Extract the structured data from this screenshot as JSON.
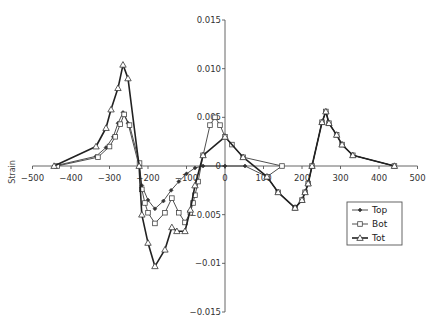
{
  "chart_data": {
    "type": "line",
    "title": "",
    "xlabel": "",
    "ylabel": "Strain",
    "xlim": [
      -500,
      500
    ],
    "ylim": [
      -0.015,
      0.015
    ],
    "xticks": [
      -500,
      -400,
      -300,
      -200,
      -100,
      0,
      100,
      200,
      300,
      400,
      500
    ],
    "xtick_labels": [
      "-500",
      "-400",
      "-300",
      "-200",
      "-100",
      "0",
      "100",
      "200",
      "300",
      "400",
      "500"
    ],
    "yticks": [
      0.015,
      0.01,
      0.005,
      0,
      -0.005,
      -0.01,
      -0.015
    ],
    "ytick_labels": [
      "0.015",
      "0.010",
      "0.005",
      "0",
      "-0.005",
      "-0.01",
      "-0.015"
    ],
    "grid": false,
    "legend_position": "lower right",
    "series": [
      {
        "name": "Top",
        "marker": "diamond",
        "line_width": 0.8,
        "x": [
          -444,
          -335,
          -309,
          -290,
          -278,
          -265,
          -252,
          -223,
          -216,
          -200,
          -182,
          -160,
          -140,
          -120,
          -100,
          -78,
          -57,
          0,
          52,
          109,
          138,
          182,
          200,
          208,
          216,
          226,
          252,
          262,
          270,
          290,
          304,
          332,
          440
        ],
        "y": [
          0.0,
          0.001,
          0.0019,
          0.003,
          0.0044,
          0.0055,
          0.0044,
          0.0,
          -0.002,
          -0.0035,
          -0.0044,
          -0.0036,
          -0.0025,
          -0.0016,
          -0.0008,
          -0.0002,
          0.0,
          0.0,
          0.0,
          -0.0011,
          -0.0027,
          -0.0043,
          -0.0035,
          -0.0027,
          -0.0018,
          0.0,
          0.0045,
          0.0056,
          0.0044,
          0.0032,
          0.0022,
          0.0011,
          0.0
        ]
      },
      {
        "name": "Bot",
        "marker": "square",
        "line_width": 0.8,
        "x": [
          -436,
          -330,
          -300,
          -285,
          -272,
          -262,
          -248,
          -222,
          -216,
          -208,
          -200,
          -182,
          -156,
          -138,
          -120,
          -104,
          -90,
          -83,
          -78,
          -70,
          -57,
          -39,
          -26,
          -13,
          0,
          18,
          47,
          148,
          109,
          138,
          182,
          200,
          208,
          216,
          226,
          252,
          262,
          270,
          290,
          304,
          332,
          440
        ],
        "y": [
          0.0,
          0.0009,
          0.002,
          0.003,
          0.0043,
          0.0053,
          0.0042,
          0.0003,
          -0.0024,
          -0.0038,
          -0.0048,
          -0.0059,
          -0.0048,
          -0.0033,
          -0.0048,
          -0.0058,
          -0.0048,
          -0.0038,
          -0.003,
          -0.0016,
          0.0011,
          0.0042,
          0.005,
          0.0042,
          0.003,
          0.0022,
          0.0009,
          0.0,
          -0.0011,
          -0.0027,
          -0.0043,
          -0.0035,
          -0.0027,
          -0.0018,
          0.0,
          0.0045,
          0.0056,
          0.0044,
          0.0032,
          0.0022,
          0.0011,
          0.0
        ]
      },
      {
        "name": "Tot",
        "marker": "triangle",
        "line_width": 1.6,
        "x": [
          -444,
          -335,
          -309,
          -296,
          -278,
          -265,
          -252,
          -223,
          -216,
          -200,
          -182,
          -156,
          -138,
          -125,
          -104,
          -90,
          -78,
          -57,
          0,
          47,
          109,
          138,
          182,
          200,
          208,
          216,
          226,
          252,
          262,
          270,
          290,
          304,
          332,
          440
        ],
        "y": [
          0.0,
          0.002,
          0.0039,
          0.0058,
          0.008,
          0.0104,
          0.009,
          0.0,
          -0.005,
          -0.0079,
          -0.0103,
          -0.0086,
          -0.0063,
          -0.0067,
          -0.0067,
          -0.0045,
          -0.002,
          0.0011,
          0.003,
          0.0009,
          -0.0011,
          -0.0027,
          -0.0043,
          -0.0035,
          -0.0027,
          -0.0018,
          0.0,
          0.0045,
          0.0056,
          0.0044,
          0.0032,
          0.0022,
          0.0011,
          0.0
        ]
      }
    ]
  },
  "legend": {
    "items": [
      {
        "label": "Top",
        "marker": "diamond"
      },
      {
        "label": "Bot",
        "marker": "square"
      },
      {
        "label": "Tot",
        "marker": "triangle"
      }
    ]
  },
  "axes": {
    "ylabel": "Strain"
  }
}
